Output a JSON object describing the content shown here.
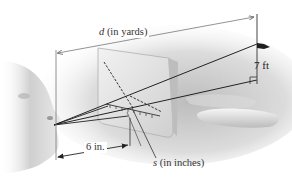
{
  "diagram": {
    "type": "geometry-illustration",
    "labels": {
      "distance_var": "d",
      "distance_unit": " (in yards)",
      "flag_height": "7 ft",
      "eye_to_card": "6 in.",
      "scale_var": "s",
      "scale_unit": " (in inches)"
    },
    "elements": [
      {
        "name": "face-profile",
        "description": "grayscale human face profile at left, eye as vertex"
      },
      {
        "name": "rangefinder-card",
        "description": "tilted translucent card with dashed diagonal scale and tick marks"
      },
      {
        "name": "flagpole",
        "description": "vertical pole with pennant flag at right"
      },
      {
        "name": "hand",
        "description": "fingers holding the card, lower right"
      },
      {
        "name": "sight-lines",
        "description": "two lines from eye: to top of flagpole and to base"
      },
      {
        "name": "right-angle-marker",
        "description": "square at base of flagpole"
      }
    ],
    "colors": {
      "line": "#2a2a2a",
      "dimension": "#777777",
      "card": "#e4e4e4",
      "background": "#ffffff"
    }
  }
}
